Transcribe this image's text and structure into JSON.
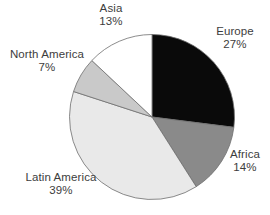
{
  "chart_data": {
    "type": "pie",
    "title": "",
    "direction": "clockwise",
    "start_angle_deg": 0,
    "legend": "none",
    "background": "#ffffff",
    "stroke_color": "#6e6e6e",
    "slices": [
      {
        "label": "Europe",
        "pct_label": "27%",
        "value": 27,
        "color": "#0a0a0a"
      },
      {
        "label": "Africa",
        "pct_label": "14%",
        "value": 14,
        "color": "#8a8a8a"
      },
      {
        "label": "Latin America",
        "pct_label": "39%",
        "value": 39,
        "color": "#e9e9e9"
      },
      {
        "label": "North America",
        "pct_label": "7%",
        "value": 7,
        "color": "#c9c9c9"
      },
      {
        "label": "Asia",
        "pct_label": "13%",
        "value": 13,
        "color": "#ffffff"
      }
    ]
  }
}
